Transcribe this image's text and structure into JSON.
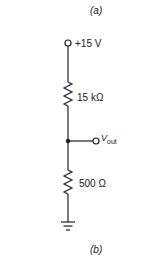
{
  "figure": {
    "caption_top": "(a)",
    "caption_bottom": "(b)"
  },
  "circuit": {
    "supply_label": "+15 V",
    "r1_label": "15 kΩ",
    "r2_label": "500 Ω",
    "output_label_main": "V",
    "output_label_sub": "out"
  }
}
